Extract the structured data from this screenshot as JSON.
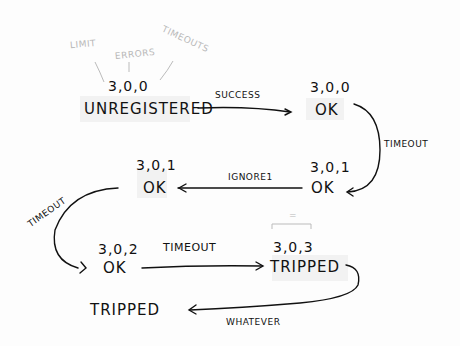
{
  "annotations": {
    "limit": "LIMIT",
    "errors": "ERRORS",
    "timeouts": "TIMEOUTS",
    "equals_mark": "="
  },
  "nodes": [
    {
      "id": "unregistered",
      "label": "UNREGISTERED",
      "tuple": "3,0,0"
    },
    {
      "id": "ok_1",
      "label": "OK",
      "tuple": "3,0,0"
    },
    {
      "id": "ok_2",
      "label": "OK",
      "tuple": "3,0,1"
    },
    {
      "id": "ok_3",
      "label": "OK",
      "tuple": "3,0,1"
    },
    {
      "id": "ok_4",
      "label": "OK",
      "tuple": "3,0,2"
    },
    {
      "id": "tripped_1",
      "label": "TRIPPED",
      "tuple": "3,0,3"
    },
    {
      "id": "tripped_2",
      "label": "TRIPPED",
      "tuple": ""
    }
  ],
  "edges": [
    {
      "from": "unregistered",
      "to": "ok_1",
      "label": "SUCCESS"
    },
    {
      "from": "ok_1",
      "to": "ok_2",
      "label": "TIMEOUT"
    },
    {
      "from": "ok_2",
      "to": "ok_3",
      "label": "IGNORE1"
    },
    {
      "from": "ok_3",
      "to": "ok_4",
      "label": "TIMEOUT"
    },
    {
      "from": "ok_4",
      "to": "tripped_1",
      "label": "TIMEOUT"
    },
    {
      "from": "tripped_1",
      "to": "tripped_2",
      "label": "WHATEVER"
    }
  ]
}
